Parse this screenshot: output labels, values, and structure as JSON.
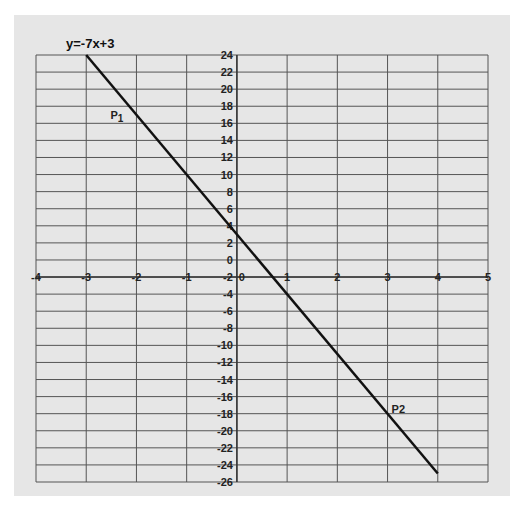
{
  "chart_data": {
    "type": "line",
    "title": "y=-7x+3",
    "xlabel": "",
    "ylabel": "",
    "xlim": [
      -4,
      5
    ],
    "ylim": [
      -26,
      24
    ],
    "x_ticks": [
      -4,
      -3,
      -2,
      -1,
      0,
      1,
      2,
      3,
      4,
      5
    ],
    "x_tick_labels": [
      "-4",
      "-3",
      "-2",
      "-1",
      "0",
      "1",
      "2",
      "3",
      "4",
      "5"
    ],
    "y_ticks": [
      24,
      22,
      20,
      18,
      16,
      14,
      12,
      10,
      8,
      6,
      4,
      2,
      0,
      -2,
      -4,
      -6,
      -8,
      -10,
      -12,
      -14,
      -16,
      -18,
      -20,
      -22,
      -24,
      -26
    ],
    "x_axis_crosses_at_y": -2,
    "grid": true,
    "series": [
      {
        "name": "y=-7x+3",
        "x": [
          -3,
          4
        ],
        "y": [
          24,
          -25
        ],
        "color": "#111111"
      }
    ],
    "annotations": [
      {
        "text": "P1",
        "x": -2,
        "y": 17
      },
      {
        "text": "P2",
        "x": 3,
        "y": -18
      }
    ]
  },
  "colors": {
    "background": "#e6e6e6",
    "grid": "#555555",
    "line": "#111111"
  }
}
